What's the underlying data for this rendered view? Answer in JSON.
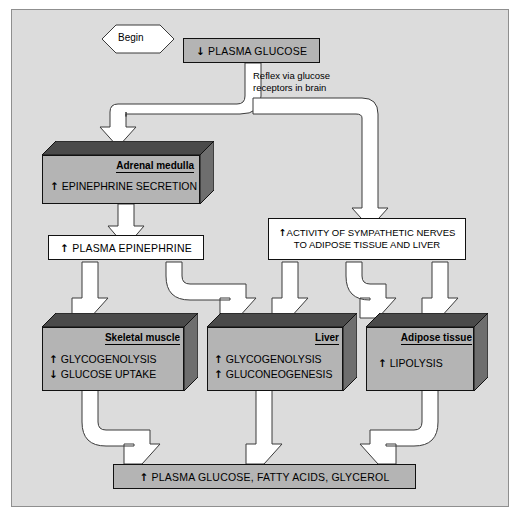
{
  "diagram": {
    "begin_label": "Begin",
    "colors": {
      "panel_bg": "#dcdcdc",
      "box_grey": "#b4b4b4",
      "box_top_dark": "#4a4a4a",
      "box_side_dark": "#6e6e6e",
      "arrow_fill": "#ffffff",
      "outline": "#111111"
    },
    "nodes": {
      "stimulus": {
        "text": "PLASMA GLUCOSE",
        "arrow": "down",
        "style": "grey-flat"
      },
      "reflex_caption": {
        "line1": "Reflex via glucose",
        "line2": "receptors in brain"
      },
      "adrenal": {
        "title": "Adrenal medulla",
        "lines": [
          {
            "arrow": "up",
            "text": "EPINEPHRINE SECRETION"
          }
        ],
        "style": "3d"
      },
      "plasma_epi": {
        "text": "PLASMA EPINEPHRINE",
        "arrow": "up",
        "style": "white-flat"
      },
      "sympathetic": {
        "line1": "ACTIVITY OF SYMPATHETIC NERVES",
        "line2": "TO ADIPOSE TISSUE AND LIVER",
        "arrow": "up",
        "style": "white-flat"
      },
      "skeletal_muscle": {
        "title": "Skeletal muscle",
        "lines": [
          {
            "arrow": "up",
            "text": "GLYCOGENOLYSIS"
          },
          {
            "arrow": "down",
            "text": "GLUCOSE UPTAKE"
          }
        ],
        "style": "3d"
      },
      "liver": {
        "title": "Liver",
        "lines": [
          {
            "arrow": "up",
            "text": "GLYCOGENOLYSIS"
          },
          {
            "arrow": "up",
            "text": "GLUCONEOGENESIS"
          }
        ],
        "style": "3d"
      },
      "adipose": {
        "title": "Adipose tissue",
        "lines": [
          {
            "arrow": "up",
            "text": "LIPOLYSIS"
          }
        ],
        "style": "3d"
      },
      "result": {
        "text": "PLASMA GLUCOSE, FATTY ACIDS, GLYCEROL",
        "arrow": "up",
        "style": "grey-flat"
      }
    },
    "glyphs": {
      "up": "↑",
      "down": "↓"
    }
  }
}
